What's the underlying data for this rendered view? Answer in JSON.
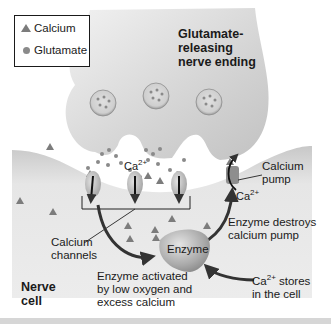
{
  "legend": {
    "items": [
      {
        "icon": "triangle",
        "label": "Calcium"
      },
      {
        "icon": "dot",
        "label": "Glutamate"
      }
    ]
  },
  "labels": {
    "nerve_ending": "Glutamate-\nreleasing\nnerve ending",
    "ca_channel": "Ca",
    "ca_channel_sup": "2+",
    "ca_pump_ion": "Ca",
    "ca_pump_ion_sup": "2+",
    "calcium_pump": "Calcium\npump",
    "calcium_channels": "Calcium\nchannels",
    "enzyme": "Enzyme",
    "enzyme_destroys": "Enzyme destroys\ncalcium pump",
    "enzyme_activated": "Enzyme activated\nby low oxygen and\nexcess calcium",
    "ca_stores_prefix": "Ca",
    "ca_stores_sup": "2+",
    "ca_stores_rest": " stores\nin the cell",
    "nerve_cell": "Nerve\ncell"
  },
  "colors": {
    "membrane": "#d9d9d9",
    "membrane_dark": "#bdbdbd",
    "particle": "#888888",
    "text": "#1a1a1a"
  }
}
